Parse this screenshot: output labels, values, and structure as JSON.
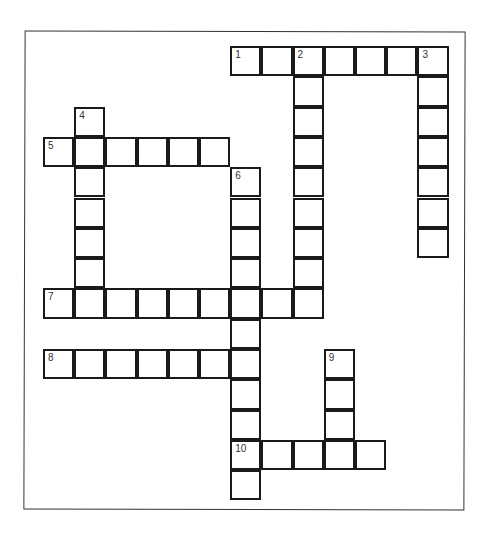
{
  "puzzle": {
    "type": "crossword",
    "cell_width": 31.2,
    "cell_height": 30.3,
    "origin_x": 44,
    "origin_y": 47,
    "entries": [
      {
        "number": "1",
        "direction": "across",
        "row": 0,
        "col": 6,
        "length": 7
      },
      {
        "number": "2",
        "direction": "down",
        "row": 0,
        "col": 8,
        "length": 9
      },
      {
        "number": "3",
        "direction": "down",
        "row": 0,
        "col": 12,
        "length": 7
      },
      {
        "number": "4",
        "direction": "down",
        "row": 2,
        "col": 1,
        "length": 7
      },
      {
        "number": "5",
        "direction": "across",
        "row": 3,
        "col": 0,
        "length": 6
      },
      {
        "number": "6",
        "direction": "down",
        "row": 4,
        "col": 6,
        "length": 11
      },
      {
        "number": "7",
        "direction": "across",
        "row": 8,
        "col": 0,
        "length": 9
      },
      {
        "number": "8",
        "direction": "across",
        "row": 10,
        "col": 0,
        "length": 7
      },
      {
        "number": "9",
        "direction": "down",
        "row": 10,
        "col": 9,
        "length": 4
      },
      {
        "number": "10",
        "direction": "across",
        "row": 13,
        "col": 6,
        "length": 5
      }
    ]
  }
}
